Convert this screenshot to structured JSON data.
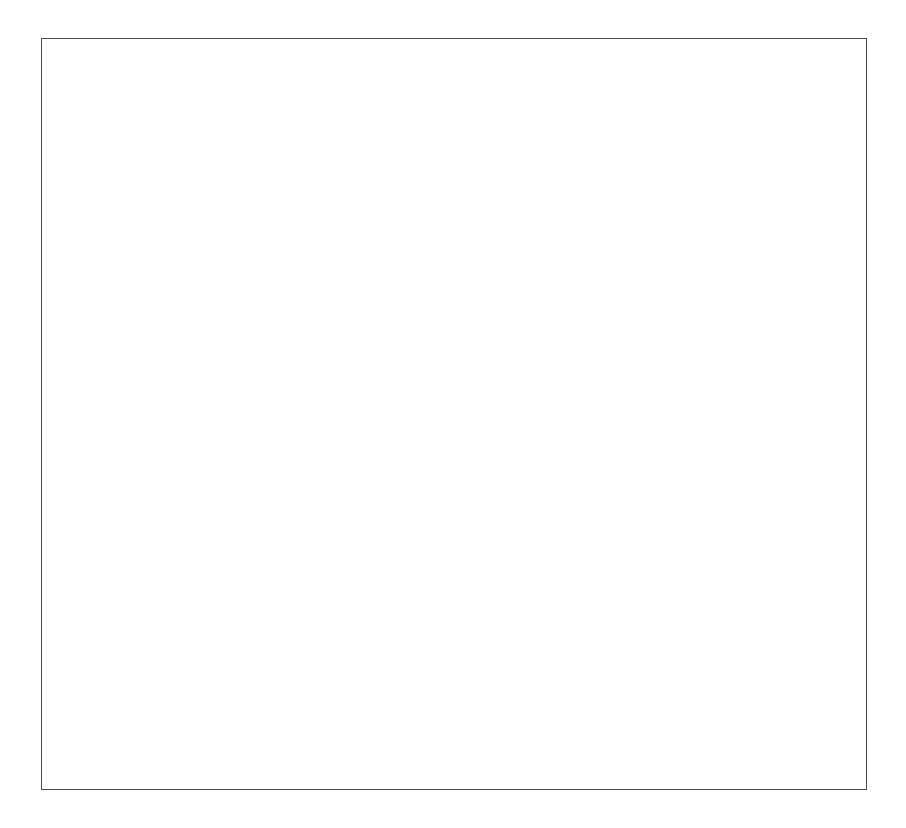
{
  "chart_data": {
    "type": "scatter",
    "title": "",
    "xlabel": "h2/h1",
    "ylabel": "Ht/Hi",
    "xscale": "log",
    "yscale": "linear",
    "xlim": [
      0.001,
      10
    ],
    "ylim": [
      0.5,
      4
    ],
    "xticks": [
      "0.001",
      "0.01",
      "0.1",
      "1",
      "10"
    ],
    "xtick_values": [
      0.001,
      0.01,
      0.1,
      1,
      10
    ],
    "yticks": [
      "0.5",
      "1",
      "1.5",
      "2",
      "2.5",
      "3",
      "3.5",
      "4"
    ],
    "ytick_values": [
      0.5,
      1,
      1.5,
      2,
      2.5,
      3,
      3.5,
      4
    ],
    "grid": false,
    "legend": "none",
    "reference_line": {
      "name": "asymptote-line",
      "y": 2,
      "style": "dashed",
      "x_start": 0.001,
      "x_end": 1.5
    },
    "annotations": [
      {
        "name": "short-waves-note",
        "lines": [
          "short waves",
          "limited by",
          "breaking"
        ],
        "x": 0.03,
        "y": 3.55
      },
      {
        "name": "long-waves-note",
        "lines": [
          "long waves",
          "Ht/Hi ---> 2",
          "for h --> 0"
        ],
        "x": 0.0035,
        "y": 1.58
      }
    ],
    "series": [
      {
        "name": "open-squares",
        "marker": "open-square",
        "color": "#1a1a1a",
        "points": [
          [
            0.00125,
            3.79
          ],
          [
            0.0017,
            3.555
          ],
          [
            0.0024,
            3.325
          ],
          [
            0.0034,
            3.11
          ],
          [
            0.0049,
            2.915
          ],
          [
            0.0069,
            2.735
          ],
          [
            0.0098,
            2.555
          ],
          [
            0.0139,
            2.4
          ],
          [
            0.0197,
            2.235
          ],
          [
            0.0278,
            2.11
          ],
          [
            0.0394,
            1.965
          ],
          [
            0.0557,
            1.86
          ],
          [
            0.0787,
            1.74
          ],
          [
            0.111,
            1.645
          ],
          [
            0.157,
            1.545
          ],
          [
            0.222,
            1.435
          ],
          [
            0.315,
            1.325
          ],
          [
            0.445,
            1.225
          ],
          [
            0.63,
            1.125
          ],
          [
            0.89,
            1.03
          ],
          [
            1.26,
            1.035
          ],
          [
            1.78,
            1.27
          ],
          [
            2.0,
            2.08
          ]
        ]
      },
      {
        "name": "open-circles",
        "marker": "open-circle",
        "color": "#1a1a1a",
        "points": [
          [
            0.0037,
            3.815
          ],
          [
            0.0052,
            3.565
          ],
          [
            0.0074,
            3.345
          ],
          [
            0.0105,
            3.135
          ],
          [
            0.0148,
            2.935
          ],
          [
            0.0209,
            2.755
          ],
          [
            0.0209,
            2.58
          ],
          [
            0.0295,
            2.455
          ],
          [
            0.0417,
            2.315
          ],
          [
            0.059,
            2.19
          ],
          [
            0.0834,
            1.97
          ],
          [
            0.118,
            1.855
          ],
          [
            0.167,
            1.735
          ],
          [
            0.236,
            1.63
          ],
          [
            0.333,
            1.525
          ],
          [
            0.471,
            1.42
          ],
          [
            0.667,
            1.32
          ],
          [
            0.943,
            1.225
          ],
          [
            1.33,
            1.12
          ],
          [
            1.88,
            1.025
          ],
          [
            2.66,
            0.93
          ],
          [
            3.76,
            0.875
          ],
          [
            5.31,
            0.965
          ],
          [
            7.5,
            1.16
          ],
          [
            8.2,
            2.6
          ]
        ]
      },
      {
        "name": "open-diamonds",
        "marker": "open-diamond",
        "color": "#1a1a1a",
        "points": [
          [
            0.0048,
            3.81
          ],
          [
            0.0068,
            3.555
          ],
          [
            0.0096,
            3.33
          ],
          [
            0.0136,
            3.12
          ],
          [
            0.0192,
            2.935
          ],
          [
            0.0272,
            2.745
          ],
          [
            0.0272,
            2.575
          ],
          [
            0.0384,
            2.44
          ],
          [
            0.0543,
            2.295
          ],
          [
            0.0768,
            2.135
          ],
          [
            0.0768,
            1.955
          ],
          [
            0.109,
            1.825
          ],
          [
            0.154,
            1.715
          ],
          [
            0.217,
            1.615
          ],
          [
            0.307,
            1.5
          ],
          [
            0.435,
            1.39
          ],
          [
            0.614,
            1.3
          ],
          [
            0.868,
            1.18
          ],
          [
            1.23,
            1.07
          ],
          [
            1.74,
            0.98
          ],
          [
            2.46,
            0.9
          ],
          [
            3.47,
            0.815
          ],
          [
            4.91,
            0.755
          ],
          [
            6.94,
            0.635
          ],
          [
            7.8,
            0.6
          ],
          [
            8.6,
            0.585
          ],
          [
            9.4,
            0.565
          ]
        ]
      },
      {
        "name": "filled-circles",
        "marker": "filled-circle",
        "color": "#1a1a1a",
        "points": [
          [
            0.00105,
            1.935
          ],
          [
            0.00148,
            1.925
          ],
          [
            0.0021,
            1.915
          ],
          [
            0.00296,
            1.9
          ],
          [
            0.00418,
            1.885
          ],
          [
            0.0059,
            1.87
          ],
          [
            0.00835,
            1.855
          ],
          [
            0.0118,
            1.84
          ],
          [
            0.0167,
            1.825
          ],
          [
            0.0236,
            1.805
          ],
          [
            0.0333,
            1.785
          ],
          [
            0.0471,
            1.76
          ],
          [
            0.0666,
            1.735
          ],
          [
            0.0941,
            1.7
          ],
          [
            0.133,
            1.665
          ],
          [
            0.188,
            1.615
          ],
          [
            0.266,
            1.555
          ],
          [
            0.375,
            1.49
          ],
          [
            0.53,
            1.41
          ],
          [
            0.75,
            1.29
          ],
          [
            1.06,
            1.16
          ],
          [
            1.5,
            1.04
          ],
          [
            2.12,
            1.015
          ],
          [
            3.0,
            0.99
          ],
          [
            4.24,
            0.915
          ],
          [
            5.99,
            0.865
          ],
          [
            6.7,
            0.935
          ],
          [
            7.5,
            1.065
          ],
          [
            8.4,
            1.225
          ]
        ]
      },
      {
        "name": "filled-squares",
        "marker": "filled-square",
        "color": "#1a1a1a",
        "points": [
          [
            0.00105,
            1.925
          ],
          [
            0.00148,
            1.915
          ],
          [
            0.0021,
            1.905
          ],
          [
            0.00296,
            1.89
          ],
          [
            0.00418,
            1.875
          ],
          [
            0.0059,
            1.86
          ],
          [
            0.00835,
            1.845
          ],
          [
            0.0118,
            1.825
          ],
          [
            0.0167,
            1.805
          ],
          [
            0.0236,
            1.78
          ],
          [
            0.0333,
            1.755
          ],
          [
            0.0471,
            1.725
          ],
          [
            0.0666,
            1.695
          ],
          [
            0.0941,
            1.655
          ],
          [
            0.133,
            1.615
          ],
          [
            0.188,
            1.56
          ],
          [
            0.266,
            1.495
          ],
          [
            0.375,
            1.425
          ],
          [
            0.53,
            1.33
          ],
          [
            0.75,
            1.22
          ],
          [
            1.06,
            1.115
          ],
          [
            1.5,
            1.025
          ],
          [
            2.12,
            1.275
          ]
        ]
      },
      {
        "name": "filled-diamonds",
        "marker": "filled-diamond",
        "color": "#1a1a1a",
        "points": [
          [
            0.00105,
            1.93
          ],
          [
            0.00148,
            1.92
          ],
          [
            0.0021,
            1.91
          ],
          [
            0.00296,
            1.895
          ],
          [
            0.00418,
            1.88
          ],
          [
            0.0059,
            1.865
          ],
          [
            0.00835,
            1.85
          ],
          [
            0.0118,
            1.835
          ],
          [
            0.0167,
            1.815
          ],
          [
            0.0236,
            1.795
          ],
          [
            0.0333,
            1.775
          ],
          [
            0.0471,
            1.745
          ],
          [
            0.0666,
            1.715
          ],
          [
            0.0941,
            1.68
          ],
          [
            0.133,
            1.64
          ],
          [
            0.188,
            1.59
          ],
          [
            0.266,
            1.525
          ],
          [
            0.375,
            1.455
          ],
          [
            0.53,
            1.365
          ],
          [
            0.75,
            1.245
          ],
          [
            1.06,
            1.115
          ],
          [
            1.5,
            0.985
          ],
          [
            2.12,
            0.9
          ],
          [
            3.0,
            0.82
          ],
          [
            4.24,
            0.745
          ],
          [
            5.99,
            0.625
          ],
          [
            6.9,
            0.585
          ],
          [
            7.8,
            0.565
          ],
          [
            8.7,
            0.545
          ]
        ]
      }
    ]
  }
}
